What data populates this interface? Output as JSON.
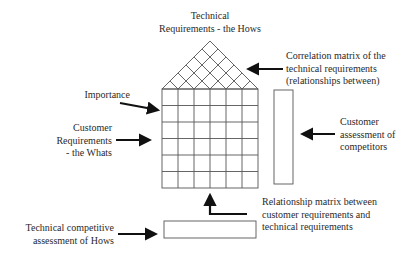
{
  "diagram": {
    "title": [
      "Technical",
      "Requirements - the Hows"
    ],
    "labels": {
      "correlation": [
        "Correlation matrix of the",
        "technical requirements",
        "(relationships between)"
      ],
      "importance": "Importance",
      "customer_requirements": [
        "Customer",
        "Requirements",
        "- the Whats"
      ],
      "customer_assessment": [
        "Customer",
        "assessment of",
        "competitors"
      ],
      "relationship": [
        "Relationship matrix between",
        "customer requirements and",
        "technical requirements"
      ],
      "technical_competitive": [
        "Technical competitive",
        "assessment of Hows"
      ]
    },
    "grid": {
      "rows": 6,
      "columns": 6
    },
    "colors": {
      "line": "#555555",
      "arrow": "#111111"
    }
  }
}
